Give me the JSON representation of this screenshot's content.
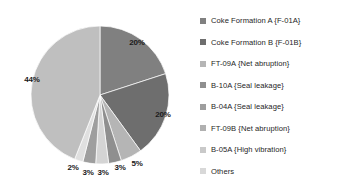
{
  "chart_data": {
    "type": "pie",
    "title": "",
    "legend_position": "right",
    "grid": false,
    "categories": [
      "Coke Formation A {F-01A}",
      "Coke Formation B {F-01B}",
      "FT-09A {Net abruption}",
      "B-10A {Seal leakage}",
      "B-04A {Seal leakage}",
      "FT-09B {Net abruption}",
      "B-05A {High vibration}",
      "Others"
    ],
    "values": [
      20,
      20,
      5,
      3,
      3,
      3,
      2,
      44
    ],
    "data_labels": [
      "20%",
      "20%",
      "5%",
      "3%",
      "3%",
      "3%",
      "2%",
      "44%"
    ],
    "colors": [
      "#808080",
      "#6e6e6e",
      "#b5b5b5",
      "#8f8f8f",
      "#d4d4d4",
      "#9e9e9e",
      "#e0e0e0",
      "#bfbfbf"
    ],
    "start_angle_deg": 0,
    "direction": "clockwise"
  },
  "slices": [
    {
      "label": "Coke Formation A {F-01A}",
      "value": 20,
      "data_label": "20%",
      "color": "#808080",
      "label_x": 137,
      "label_y": 42
    },
    {
      "label": "Coke Formation B {F-01B}",
      "value": 20,
      "data_label": "20%",
      "color": "#6e6e6e",
      "label_x": 163,
      "label_y": 114
    },
    {
      "label": "FT-09A {Net abruption}",
      "value": 5,
      "data_label": "5%",
      "color": "#b5b5b5",
      "label_x": 137,
      "label_y": 163
    },
    {
      "label": "B-10A {Seal leakage}",
      "value": 3,
      "data_label": "3%",
      "color": "#8f8f8f",
      "label_x": 120,
      "label_y": 167
    },
    {
      "label": "B-04A {Seal leakage}",
      "value": 3,
      "data_label": "3%",
      "color": "#d4d4d4",
      "label_x": 103,
      "label_y": 172
    },
    {
      "label": "FT-09B {Net abruption}",
      "value": 3,
      "data_label": "3%",
      "color": "#9e9e9e",
      "label_x": 88,
      "label_y": 172
    },
    {
      "label": "B-05A {High vibration}",
      "value": 2,
      "data_label": "2%",
      "color": "#e0e0e0",
      "label_x": 73,
      "label_y": 167
    },
    {
      "label": "Others",
      "value": 44,
      "data_label": "44%",
      "color": "#bfbfbf",
      "label_x": 32,
      "label_y": 79
    }
  ],
  "legend": {
    "items": [
      {
        "label": "Coke Formation A {F-01A}",
        "color": "#808080"
      },
      {
        "label": "Coke Formation B {F-01B}",
        "color": "#6e6e6e"
      },
      {
        "label": "FT-09A {Net abruption}",
        "color": "#b5b5b5"
      },
      {
        "label": "B-10A {Seal leakage}",
        "color": "#8f8f8f"
      },
      {
        "label": "B-04A {Seal leakage}",
        "color": "#9e9e9e"
      },
      {
        "label": "FT-09B {Net abruption}",
        "color": "#b0b0b0"
      },
      {
        "label": "B-05A {High vibration}",
        "color": "#c9c9c9"
      },
      {
        "label": "Others",
        "color": "#d8d8d8"
      }
    ]
  }
}
